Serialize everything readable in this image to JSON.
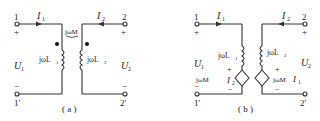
{
  "figure_a": {
    "caption": "( a )",
    "port1": {
      "terminal_top": "1",
      "terminal_bottom": "1′",
      "plus": "+",
      "minus": "−",
      "voltage": "U",
      "voltage_sub": "1"
    },
    "port2": {
      "terminal_top": "2",
      "terminal_bottom": "2′",
      "plus": "+",
      "minus": "−",
      "voltage": "U",
      "voltage_sub": "2"
    },
    "current1": {
      "label": "I",
      "sub": "1"
    },
    "current2": {
      "label": "I",
      "sub": "2"
    },
    "inductor1": {
      "label": "jωL",
      "sub": "1"
    },
    "inductor2": {
      "label": "jωL",
      "sub": "2"
    },
    "mutual": {
      "label": "jωM"
    }
  },
  "figure_b": {
    "caption": "( b )",
    "port1": {
      "terminal_top": "1",
      "terminal_bottom": "1′",
      "plus": "+",
      "minus": "−",
      "voltage": "U",
      "voltage_sub": "1"
    },
    "port2": {
      "terminal_top": "2",
      "terminal_bottom": "2′",
      "plus": "+",
      "minus": "−",
      "voltage": "U",
      "voltage_sub": "2"
    },
    "current1": {
      "label": "I",
      "sub": "1"
    },
    "current2": {
      "label": "I",
      "sub": "2"
    },
    "inductor1": {
      "label": "jωL",
      "sub": "1"
    },
    "inductor2": {
      "label": "jωL",
      "sub": "2"
    },
    "source1": {
      "label": "jωM",
      "ctrl": "I",
      "ctrl_sub": "2",
      "plus": "+",
      "minus": "−"
    },
    "source2": {
      "label": "jωM",
      "ctrl": "I",
      "ctrl_sub": "1",
      "plus": "+",
      "minus": "−"
    }
  }
}
